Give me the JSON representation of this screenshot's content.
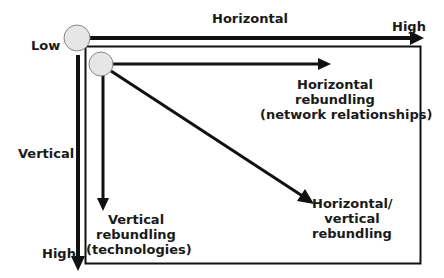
{
  "axes": {
    "horizontal_title": "Horizontal",
    "vertical_title": "Vertical",
    "low_label": "Low",
    "high_x_label": "High",
    "high_y_label": "High"
  },
  "outcomes": {
    "horizontal": {
      "line1": "Horizontal",
      "line2": "rebundling",
      "line3": "(network relationships)"
    },
    "vertical": {
      "line1": "Vertical",
      "line2": "rebundling",
      "line3": "(technologies)"
    },
    "diagonal": {
      "line1": "Horizontal/",
      "line2": "vertical",
      "line3": "rebundling"
    }
  },
  "colors": {
    "line": "#111111",
    "circle_fill": "#e6e6e6",
    "circle_stroke": "#888888"
  }
}
